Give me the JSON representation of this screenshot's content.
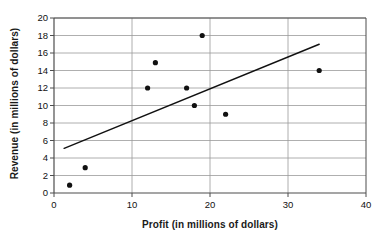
{
  "chart_data": {
    "type": "scatter",
    "title": "",
    "xlabel": "Profit (in millions of dollars)",
    "ylabel": "Revenue (in millions of dollars)",
    "xlim": [
      0,
      40
    ],
    "ylim": [
      0,
      20
    ],
    "xticks": [
      0,
      10,
      20,
      30,
      40
    ],
    "yticks": [
      0,
      2,
      4,
      6,
      8,
      10,
      12,
      14,
      16,
      18,
      20
    ],
    "xtick_labels": [
      "0",
      "10",
      "20",
      "30",
      "40"
    ],
    "ytick_labels": [
      "0",
      "2",
      "4",
      "6",
      "8",
      "10",
      "12",
      "14",
      "16",
      "18",
      "20"
    ],
    "grid": {
      "horizontal": true,
      "vertical": true,
      "horizontal_step": 2,
      "vertical_step": 10,
      "color": "#9a9a9a"
    },
    "legend": null,
    "series": [
      {
        "name": "Revenue vs Profit",
        "type": "scatter",
        "marker": "circle",
        "marker_color": "#111111",
        "marker_size": 4,
        "points": [
          {
            "x": 2,
            "y": 0.9
          },
          {
            "x": 4,
            "y": 2.9
          },
          {
            "x": 12,
            "y": 12
          },
          {
            "x": 13,
            "y": 14.9
          },
          {
            "x": 17,
            "y": 12
          },
          {
            "x": 18,
            "y": 10
          },
          {
            "x": 19,
            "y": 18
          },
          {
            "x": 22,
            "y": 9
          },
          {
            "x": 34,
            "y": 14
          }
        ]
      },
      {
        "name": "Trend line",
        "type": "line",
        "line_color": "#111111",
        "line_width": 1.4,
        "endpoints": [
          {
            "x": 1.3,
            "y": 5.1
          },
          {
            "x": 34,
            "y": 17.0
          }
        ]
      }
    ],
    "plot_area": {
      "left_px": 54,
      "right_px": 366,
      "top_px": 18,
      "bottom_px": 193,
      "border_color": "#4d4d4d",
      "background": "#ffffff"
    }
  }
}
